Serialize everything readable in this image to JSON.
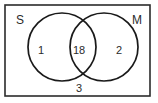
{
  "diagram": {
    "type": "venn-2-set",
    "title": "",
    "universe": {
      "name": "universal-set-rectangle",
      "outside_value": "3"
    },
    "sets": [
      {
        "id": "S",
        "label": "S",
        "only_value": "1"
      },
      {
        "id": "M",
        "label": "M",
        "only_value": "2"
      }
    ],
    "intersection": {
      "label": "S and M",
      "value": "18"
    },
    "colors": {
      "stroke": "#1a1a1a",
      "frame": "#2b2b2b",
      "text": "#2b2b2b",
      "background": "#ffffff"
    }
  }
}
